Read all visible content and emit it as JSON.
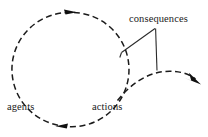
{
  "diagram": {
    "canvas": {
      "width": 208,
      "height": 137,
      "background": "#ffffff"
    },
    "stroke_color": "#1b1b1b",
    "leader_color": "#2a2a2a",
    "labels": {
      "consequences": "consequences",
      "agents": "agents",
      "actions": "actions"
    },
    "shapes": {
      "cycle_circle": {
        "style": "dashed",
        "center_x": 68.5,
        "center_y": 69.5,
        "radius": 57
      },
      "cycle_arrow_top": {
        "x": 71,
        "y": 12,
        "direction": "clockwise-right"
      },
      "cycle_arrow_bottom": {
        "x": 62,
        "y": 126,
        "direction": "clockwise-left"
      },
      "outgoing_curve": {
        "style": "dashed",
        "start_x": 118,
        "start_y": 100,
        "end_x": 198,
        "end_y": 81
      },
      "outgoing_arrow": {
        "x": 200,
        "y": 83,
        "direction": "right-down"
      },
      "leader_junction": {
        "x": 155,
        "y": 28
      },
      "leader_to_circle_end": {
        "x": 122,
        "y": 52
      },
      "leader_to_curve_end": {
        "x": 157,
        "y": 70
      }
    }
  }
}
